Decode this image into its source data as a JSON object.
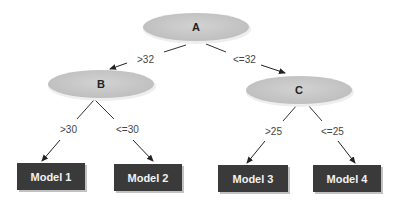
{
  "nodes": {
    "A": {
      "label": "A"
    },
    "B": {
      "label": "B"
    },
    "C": {
      "label": "C"
    }
  },
  "edges": {
    "a_b": ">32",
    "a_c": "<=32",
    "b_m1": ">30",
    "b_m2": "<=30",
    "c_m3": ">25",
    "c_m4": "<=25"
  },
  "leaves": {
    "m1": "Model 1",
    "m2": "Model 2",
    "m3": "Model 3",
    "m4": "Model 4"
  },
  "colors": {
    "node_fill": "#c8c8c8",
    "leaf_fill": "#3a3a3a",
    "edge": "#222222"
  }
}
